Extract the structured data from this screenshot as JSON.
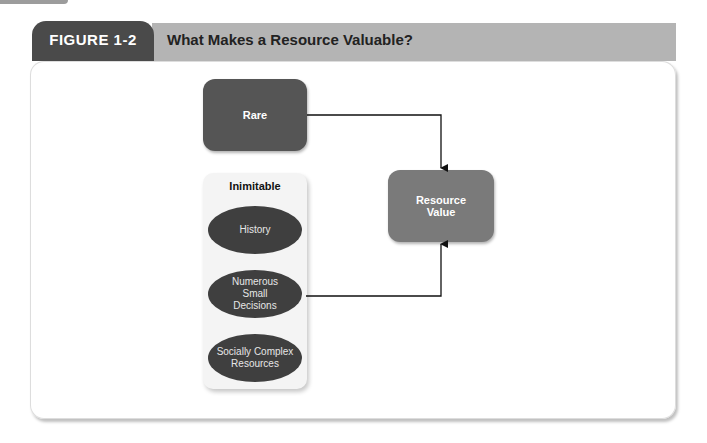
{
  "figure": {
    "label": "FIGURE 1-2",
    "title": "What Makes a Resource Valuable?"
  },
  "diagram": {
    "rare_box": {
      "label": "Rare",
      "color": "#555555"
    },
    "inimitable_group": {
      "title": "Inimitable",
      "items": [
        {
          "label": "History"
        },
        {
          "label": "Numerous Small Decisions"
        },
        {
          "label": "Socially Complex Resources"
        }
      ]
    },
    "value_box": {
      "label": "Resource Value",
      "color": "#7a7a7a"
    },
    "edges": [
      {
        "from": "Rare",
        "to": "Resource Value"
      },
      {
        "from": "Numerous Small Decisions",
        "to": "Resource Value"
      }
    ]
  },
  "colors": {
    "tab": "#4a4a4a",
    "header_band": "#b4b4b4",
    "oval": "#3f3f3f"
  }
}
